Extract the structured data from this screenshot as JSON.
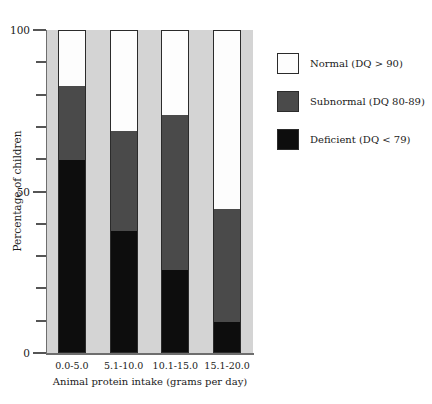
{
  "chart_data": {
    "type": "bar",
    "subtype": "stacked-vertical-percentage",
    "title": "",
    "xlabel": "Animal protein intake (grams per day)",
    "ylabel": "Percentage of children",
    "categories": [
      "0.0-5.0",
      "5.1-10.0",
      "10.1-15.0",
      "15.1-20.0"
    ],
    "series": [
      {
        "name": "Deficient (DQ < 79)",
        "color": "#0d0d0d",
        "values": [
          60,
          38,
          26,
          10
        ]
      },
      {
        "name": "Subnormal (DQ 80-89)",
        "color": "#4a4a4a",
        "values": [
          23,
          31,
          48,
          35
        ]
      },
      {
        "name": "Normal (DQ > 90)",
        "color": "#fdfdfd",
        "values": [
          17,
          31,
          26,
          55
        ]
      }
    ],
    "ylim": [
      0,
      100
    ],
    "y_major_ticks": [
      0,
      50,
      100
    ],
    "y_major_tick_labels": [
      "0",
      "50",
      "100"
    ],
    "y_minor_ticks": [
      10,
      20,
      30,
      40,
      60,
      70,
      80,
      90
    ],
    "grid": false,
    "legend_position": "right-top",
    "legend_entries": [
      {
        "label": "Normal (DQ > 90)",
        "swatch": "#fdfdfd"
      },
      {
        "label": "Subnormal (DQ 80-89)",
        "swatch": "#4a4a4a"
      },
      {
        "label": "Deficient (DQ < 79)",
        "swatch": "#0d0d0d"
      }
    ],
    "plot_background": "#d4d4d4",
    "axis_color": "#6e6e6e"
  }
}
